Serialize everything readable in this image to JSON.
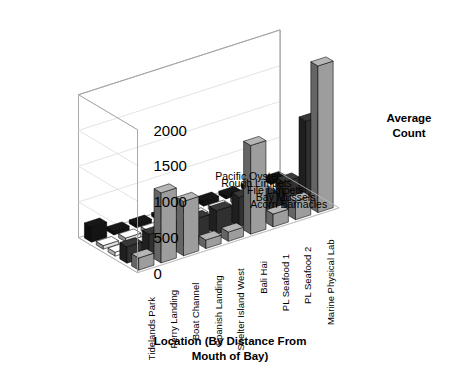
{
  "chart_data": {
    "type": "bar",
    "subtype": "3d-grouped-bar",
    "title": "",
    "xlabel": "Location (By Distance From Mouth of Bay)",
    "ylabel": "",
    "zlabel": "Average Count",
    "zlim": [
      0,
      2000
    ],
    "zticks": [
      0,
      500,
      1000,
      1500,
      2000
    ],
    "grid": true,
    "legend_position": "none",
    "categories": [
      "Marine Physical Lab",
      "PL Seafood 2",
      "PL Seafood 1",
      "Bali Hai",
      "Shelter Island West",
      "Spanish Landing",
      "Boat Channel",
      "Ferry Landing",
      "Tidelands Park"
    ],
    "series": [
      {
        "name": "Acorn Barnacles",
        "color": "#8c8c8c",
        "values": [
          2050,
          260,
          180,
          1240,
          130,
          120,
          760,
          980,
          170
        ]
      },
      {
        "name": "Bay Mussels",
        "color": "#2b2b2b",
        "values": [
          1180,
          430,
          330,
          420,
          330,
          310,
          300,
          300,
          230
        ]
      },
      {
        "name": "File Limpets",
        "color": "#f2f2f2",
        "values": [
          150,
          60,
          60,
          60,
          55,
          60,
          60,
          60,
          55
        ]
      },
      {
        "name": "Rough Limpets",
        "color": "#c6c6c6",
        "values": [
          70,
          55,
          55,
          55,
          50,
          55,
          55,
          55,
          50
        ]
      },
      {
        "name": "Pacific Oyster",
        "color": "#121212",
        "values": [
          55,
          50,
          50,
          70,
          55,
          50,
          50,
          55,
          210
        ]
      }
    ]
  },
  "axes": {
    "x_title_line1": "Location (By Distance From",
    "x_title_line2": "Mouth of Bay)",
    "z_title_line1": "Average",
    "z_title_line2": "Count"
  }
}
